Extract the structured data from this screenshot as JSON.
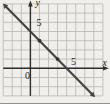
{
  "figure": {
    "colors": {
      "background": "#f1efeb",
      "grid": "#b1afaa",
      "axis": "#2e2e2c",
      "line": "#454543",
      "point": "#343432",
      "text": "#1d1d1b"
    }
  },
  "chart_data": {
    "type": "line",
    "title": "",
    "axis": {
      "xlabel": "x",
      "ylabel": "y",
      "xlim": [
        -3,
        8
      ],
      "ylim": [
        -3,
        7
      ],
      "grid": true,
      "x_tick_label": "5",
      "x_tick_value": 5,
      "y_tick_label": "5",
      "y_tick_value": 5,
      "origin_label": "0"
    },
    "series": [
      {
        "name": "line",
        "slope": -1,
        "y_intercept": 4,
        "x_intercept": 4,
        "points_on_line": [
          [
            0,
            4
          ],
          [
            1,
            3
          ],
          [
            3,
            1
          ],
          [
            4,
            0
          ]
        ],
        "marked_points": [
          [
            1,
            3
          ],
          [
            3,
            1
          ]
        ],
        "arrowheads": "both-ends"
      }
    ]
  }
}
